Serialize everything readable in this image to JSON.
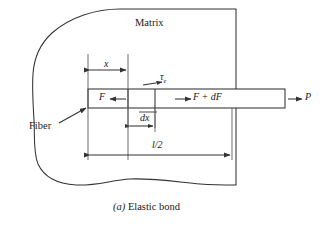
{
  "figure": {
    "caption_prefix": "(a)",
    "caption_text": "Elastic bond",
    "caption_full": "(a) Elastic bond"
  },
  "labels": {
    "matrix": "Matrix",
    "fiber": "Fiber",
    "distance_x": "x",
    "shear_stress": "τ",
    "shear_stress_subscript": "e",
    "force_left": "F",
    "force_right": "F + dF",
    "applied_load": "P",
    "element_width": "dx",
    "half_length": "l/2"
  },
  "colors": {
    "stroke": "#333333",
    "background": "#ffffff",
    "text": "#1a1a1a"
  },
  "geometry": {
    "canvas_width": 323,
    "canvas_height": 228,
    "fiber_left": 88,
    "fiber_right": 285,
    "fiber_top": 89,
    "fiber_bottom": 108,
    "element_left": 128,
    "element_right": 155,
    "matrix_right_edge": 236,
    "dim_x_from": 88,
    "dim_x_to": 128,
    "dim_l2_from": 88,
    "dim_l2_to": 232
  }
}
